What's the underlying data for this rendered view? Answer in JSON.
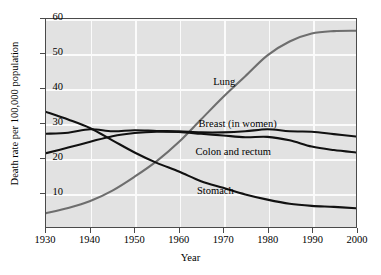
{
  "chart_data": {
    "type": "line",
    "title": "",
    "xlabel": "Year",
    "ylabel": "Death rate per 100,000 population",
    "xlim": [
      1930,
      2000
    ],
    "ylim": [
      0,
      60
    ],
    "xticks": [
      1930,
      1940,
      1950,
      1960,
      1970,
      1980,
      1990,
      2000
    ],
    "yticks": [
      10,
      20,
      30,
      40,
      50,
      60
    ],
    "grid": true,
    "legend_position": "inline-annotations",
    "series": [
      {
        "name": "Lung",
        "color": "#6e6e6e",
        "label_x": 1970,
        "label_y": 42,
        "x": [
          1930,
          1935,
          1940,
          1945,
          1950,
          1955,
          1960,
          1965,
          1970,
          1975,
          1980,
          1985,
          1990,
          1995,
          2000
        ],
        "values": [
          4.0,
          5.5,
          7.5,
          10.5,
          14.5,
          19.0,
          24.5,
          31.0,
          37.5,
          43.5,
          49.5,
          53.5,
          55.8,
          56.5,
          56.6
        ]
      },
      {
        "name": "Breast (in women)",
        "color": "#111111",
        "label_x": 1973,
        "label_y": 30,
        "x": [
          1930,
          1935,
          1940,
          1945,
          1950,
          1955,
          1960,
          1965,
          1970,
          1975,
          1980,
          1985,
          1990,
          1995,
          2000
        ],
        "values": [
          26.9,
          27.2,
          28.2,
          27.6,
          27.9,
          27.7,
          27.6,
          27.3,
          27.3,
          27.6,
          28.2,
          27.6,
          27.5,
          26.8,
          26.1
        ]
      },
      {
        "name": "Colon and rectum",
        "color": "#111111",
        "label_x": 1972,
        "label_y": 22,
        "x": [
          1930,
          1935,
          1940,
          1945,
          1950,
          1955,
          1960,
          1965,
          1970,
          1975,
          1980,
          1985,
          1990,
          1995,
          2000
        ],
        "values": [
          21.3,
          22.9,
          24.6,
          26.2,
          27.1,
          27.5,
          27.4,
          26.9,
          26.4,
          25.9,
          26.0,
          25.0,
          23.2,
          22.2,
          21.5
        ]
      },
      {
        "name": "Stomach",
        "color": "#111111",
        "label_x": 1968,
        "label_y": 11,
        "x": [
          1930,
          1935,
          1940,
          1945,
          1950,
          1955,
          1960,
          1965,
          1970,
          1975,
          1980,
          1985,
          1990,
          1995,
          2000
        ],
        "values": [
          33.2,
          31.0,
          28.5,
          25.0,
          21.5,
          18.5,
          16.0,
          13.2,
          11.3,
          9.4,
          7.9,
          6.7,
          6.1,
          5.8,
          5.4
        ]
      }
    ]
  }
}
